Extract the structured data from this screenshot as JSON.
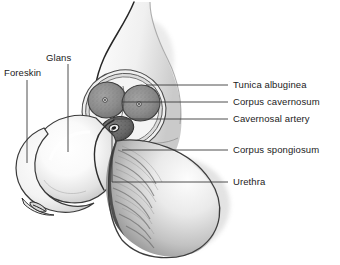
{
  "figure": {
    "background_color": "#ffffff",
    "text_color": "#1b1b1b",
    "line_color": "#3a3a3a",
    "width": 340,
    "height": 265
  },
  "labels": {
    "foreskin": "Foreskin",
    "glans": "Glans",
    "tunica_albuginea": "Tunica albuginea",
    "corpus_cavernosum": "Corpus cavernosum",
    "cavernosal_artery": "Cavernosal artery",
    "corpus_spongiosum": "Corpus spongiosum",
    "urethra": "Urethra"
  },
  "left_labels": [
    {
      "key": "glans",
      "text": "Glans",
      "x": 46,
      "y": 52,
      "leader_x": 68,
      "leader_y1": 64,
      "leader_y2": 152
    },
    {
      "key": "foreskin",
      "text": "Foreskin",
      "x": 4,
      "y": 67,
      "leader_x": 27,
      "leader_y1": 80,
      "leader_y2": 163
    }
  ],
  "right_labels": [
    {
      "key": "tunica_albuginea",
      "text": "Tunica albuginea",
      "x": 233,
      "y": 79,
      "leader_x1": 146,
      "leader_x2": 228,
      "leader_y": 85
    },
    {
      "key": "corpus_cavernosum",
      "text": "Corpus cavernosum",
      "x": 233,
      "y": 96,
      "leader_x1": 122,
      "leader_x2": 228,
      "leader_y": 102
    },
    {
      "key": "cavernosal_artery",
      "text": "Cavernosal artery",
      "x": 233,
      "y": 113,
      "leader_x1": 113,
      "leader_x2": 228,
      "leader_y": 119
    },
    {
      "key": "corpus_spongiosum",
      "text": "Corpus spongiosum",
      "x": 233,
      "y": 144,
      "leader_x1": 122,
      "leader_x2": 228,
      "leader_y": 150
    },
    {
      "key": "urethra",
      "text": "Urethra",
      "x": 233,
      "y": 176,
      "leader_x1": 112,
      "leader_x2": 228,
      "leader_y": 182
    }
  ],
  "structures": {
    "glans_fill": "#f2f2f2",
    "corpora_fill": "#8d8d8d",
    "spongiosum_fill": "#6e6e6e",
    "tunica_fill": "#d8d8d8",
    "scrotum_fill": "#bdbdbd",
    "outline": "#2b2b2b"
  }
}
